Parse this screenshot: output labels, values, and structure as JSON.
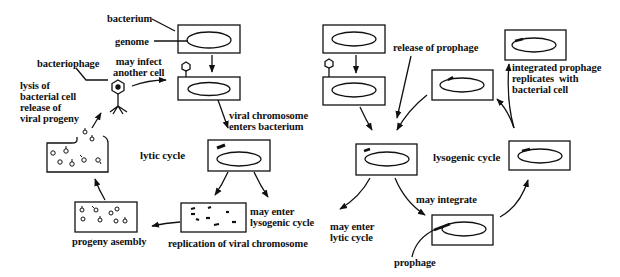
{
  "diagram": {
    "type": "biological-process-diagram",
    "colors": {
      "ink": "#111111",
      "background": "#ffffff"
    },
    "lytic": {
      "title": "lytic cycle",
      "labels": {
        "bacterium": "bacterium",
        "genome": "genome",
        "bacteriophage": "bacteriophage",
        "may_infect": "may infect\nanother cell",
        "lysis": "lysis of\nbacterial cell\nrelease of\nviral progeny",
        "viral_chromosome": "viral chromosome\nenters bacterium",
        "may_enter_lysogenic": "may enter\nlysogenic cycle",
        "replication": "replication of viral chromosome",
        "progeny": "progeny asembly"
      },
      "steps": [
        "bacterium with genome",
        "bacteriophage attaches",
        "viral chromosome enters bacterium",
        "replication of viral chromosome",
        "progeny asembly",
        "lysis of bacterial cell release of viral progeny",
        "may infect another cell"
      ]
    },
    "lysogenic": {
      "title": "lysogenic cycle",
      "labels": {
        "release": "release of prophage",
        "integrated": "integrated prophage\nreplicates  with\nbacterial cell",
        "may_integrate": "may integrate",
        "may_enter_lytic": "may enter\nlytic cycle",
        "prophage": "prophage"
      },
      "steps": [
        "bacterium with genome",
        "bacteriophage attaches",
        "viral chromosome in cell",
        "may integrate (prophage)",
        "integrated prophage replicates with bacterial cell",
        "release of prophage",
        "may enter lytic cycle"
      ]
    }
  }
}
